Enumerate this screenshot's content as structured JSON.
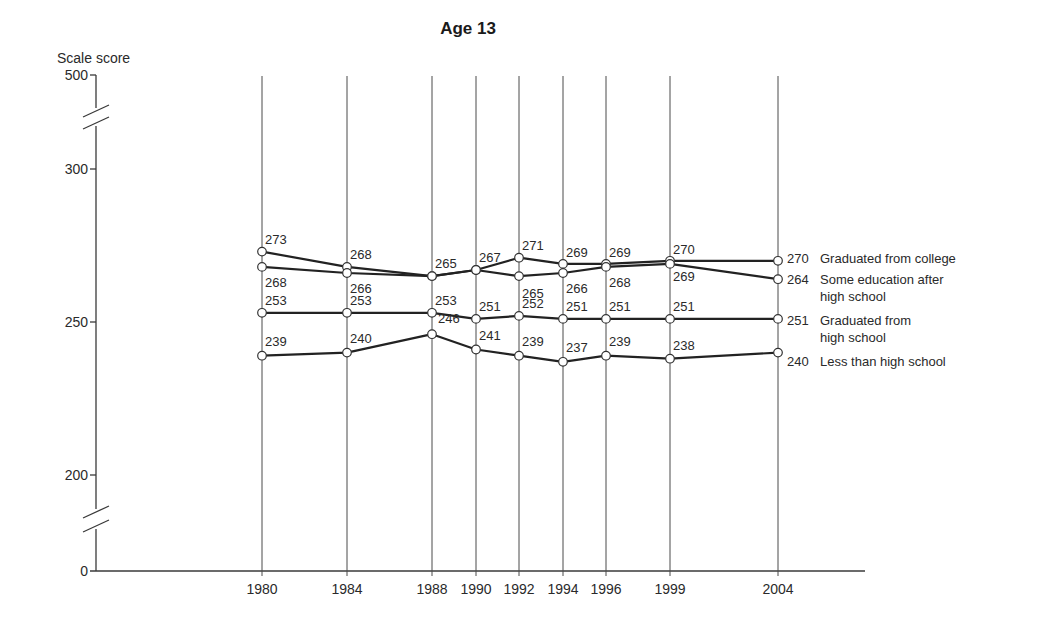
{
  "chart_data": {
    "type": "line",
    "title": "Age 13",
    "xlabel": "",
    "ylabel": "Scale score",
    "x": [
      1980,
      1984,
      1988,
      1990,
      1992,
      1994,
      1996,
      1999,
      2004
    ],
    "categories": [
      "1980",
      "1984",
      "1988",
      "1990",
      "1992",
      "1994",
      "1996",
      "1999",
      "2004"
    ],
    "y_ticks": [
      "0",
      "200",
      "250",
      "300",
      "500"
    ],
    "ylim": [
      0,
      500
    ],
    "axis_breaks": [
      [
        0,
        200
      ],
      [
        300,
        500
      ]
    ],
    "grid": "vertical lines at each year",
    "legend_position": "right, inline labels at 2004 end",
    "series": [
      {
        "name": "Graduated from college",
        "label_lines": [
          "Graduated from college"
        ],
        "values": [
          273,
          268,
          265,
          267,
          271,
          269,
          269,
          270,
          270
        ]
      },
      {
        "name": "Some education after high school",
        "label_lines": [
          "Some education after",
          "high school"
        ],
        "values": [
          268,
          266,
          265,
          267,
          265,
          266,
          268,
          269,
          264
        ]
      },
      {
        "name": "Graduated from high school",
        "label_lines": [
          "Graduated from",
          "high school"
        ],
        "values": [
          253,
          253,
          253,
          251,
          252,
          251,
          251,
          251,
          251
        ]
      },
      {
        "name": "Less than high school",
        "label_lines": [
          "Less than high school"
        ],
        "values": [
          239,
          240,
          246,
          241,
          239,
          237,
          239,
          238,
          240
        ]
      }
    ]
  },
  "labels": {
    "title": "Age 13",
    "y_axis_title": "Scale score"
  }
}
